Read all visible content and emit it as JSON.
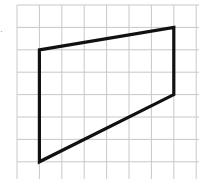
{
  "figure": {
    "type": "grid-polygon",
    "grid": {
      "origin_px": [
        17,
        5
      ],
      "cell_px": 22.4,
      "columns": 8,
      "rows": 8,
      "line_color": "#c8c8c8"
    },
    "polygon": {
      "stroke_color": "#111111",
      "stroke_width": 3.2,
      "vertices_grid": [
        [
          1,
          2
        ],
        [
          7,
          1
        ],
        [
          7,
          4
        ],
        [
          1,
          7
        ]
      ],
      "vertex_labels": []
    },
    "left_edge_mark": "·"
  }
}
